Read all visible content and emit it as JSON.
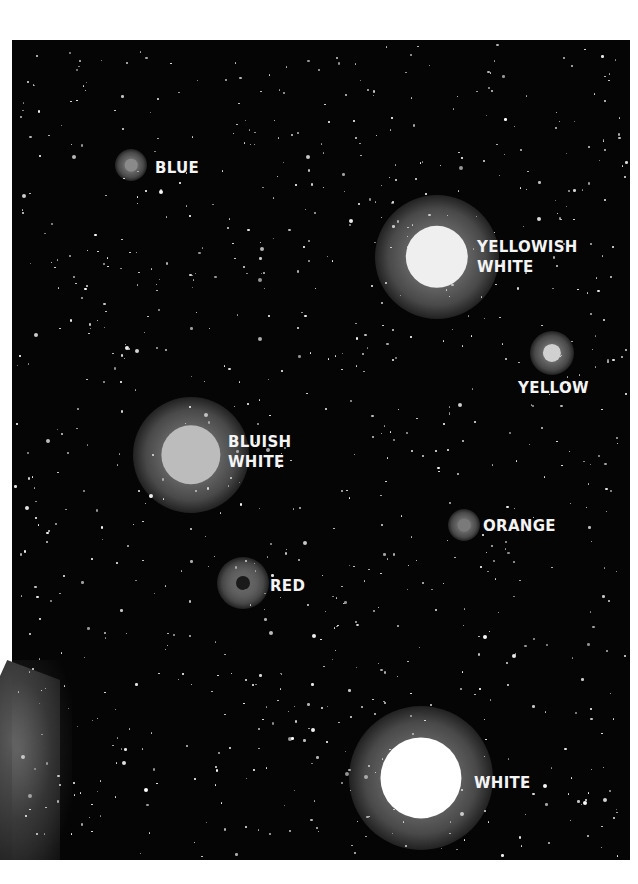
{
  "image": {
    "description": "Illustration of star colors against a dark starfield",
    "background_color": "#050505",
    "paper_color": "#ffffff"
  },
  "stars": [
    {
      "id": "blue",
      "label": "BLUE",
      "cx": 131,
      "cy": 165,
      "core": 9,
      "halo": 16,
      "core_color": "#8a8a8a",
      "label_x": 155,
      "label_y": 158
    },
    {
      "id": "yellowish-white",
      "label": "YELLOWISH\nWHITE",
      "cx": 437,
      "cy": 257,
      "core": 40,
      "halo": 62,
      "core_color": "#efefef",
      "label_x": 477,
      "label_y": 237
    },
    {
      "id": "yellow",
      "label": "YELLOW",
      "cx": 552,
      "cy": 353,
      "core": 13,
      "halo": 22,
      "core_color": "#d0d0d0",
      "label_x": 518,
      "label_y": 378
    },
    {
      "id": "bluish-white",
      "label": "BLUISH\nWHITE",
      "cx": 191,
      "cy": 455,
      "core": 38,
      "halo": 58,
      "core_color": "#bcbcbc",
      "label_x": 228,
      "label_y": 432
    },
    {
      "id": "orange",
      "label": "ORANGE",
      "cx": 464,
      "cy": 525,
      "core": 9,
      "halo": 16,
      "core_color": "#7a7a7a",
      "label_x": 483,
      "label_y": 516
    },
    {
      "id": "red",
      "label": "RED",
      "cx": 243,
      "cy": 583,
      "core": 10,
      "halo": 26,
      "core_color": "#1a1a1a",
      "label_x": 270,
      "label_y": 576
    },
    {
      "id": "white",
      "label": "WHITE",
      "cx": 421,
      "cy": 778,
      "core": 52,
      "halo": 72,
      "core_color": "#ffffff",
      "label_x": 474,
      "label_y": 773
    }
  ]
}
